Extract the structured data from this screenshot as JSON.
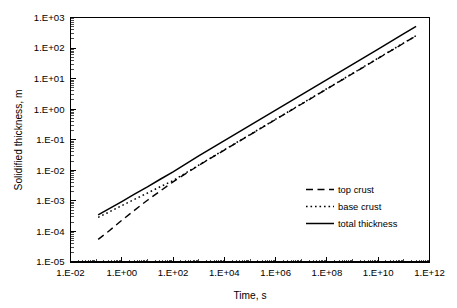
{
  "chart_data": {
    "type": "line",
    "title": "",
    "subtitle": "",
    "xlabel": "Time, s",
    "ylabel": "Solidified thickness, m",
    "xscale": "log",
    "yscale": "log",
    "xlim": [
      0.01,
      1000000000000
    ],
    "ylim": [
      1e-05,
      1000
    ],
    "grid": false,
    "legend_position": "inside-lower-right",
    "x_tick_labels": [
      "1.E-02",
      "1.E+00",
      "1.E+02",
      "1.E+04",
      "1.E+06",
      "1.E+08",
      "1.E+10",
      "1.E+12"
    ],
    "x_tick_values": [
      0.01,
      1,
      100,
      10000,
      1000000,
      100000000,
      10000000000,
      1000000000000
    ],
    "y_tick_labels": [
      "1.E-05",
      "1.E-04",
      "1.E-03",
      "1.E-02",
      "1.E-01",
      "1.E+00",
      "1.E+01",
      "1.E+02",
      "1.E+03"
    ],
    "y_tick_values": [
      1e-05,
      0.0001,
      0.001,
      0.01,
      0.1,
      1,
      10,
      100,
      1000
    ],
    "minor_ticks": true,
    "series": [
      {
        "name": "top crust",
        "style": "dashed",
        "color": "#000000",
        "x": [
          0.12,
          0.3,
          1,
          3,
          10,
          31.6,
          100,
          1000,
          10000,
          100000,
          1000000,
          10000000,
          100000000,
          1000000000,
          10000000000,
          100000000000,
          300000000000
        ],
        "y": [
          5.5e-05,
          0.0001,
          0.00023,
          0.00048,
          0.00105,
          0.0021,
          0.0042,
          0.0145,
          0.046,
          0.145,
          0.46,
          1.45,
          4.6,
          14.5,
          46,
          145,
          250
        ]
      },
      {
        "name": "base crust",
        "style": "dotted",
        "color": "#000000",
        "x": [
          0.12,
          0.3,
          1,
          3,
          10,
          31.6,
          100,
          1000,
          10000,
          100000,
          1000000,
          10000000,
          100000000,
          1000000000,
          10000000000,
          100000000000,
          300000000000
        ],
        "y": [
          0.00029,
          0.00042,
          0.0007,
          0.0011,
          0.0018,
          0.0029,
          0.0046,
          0.0148,
          0.047,
          0.148,
          0.47,
          1.48,
          4.7,
          14.8,
          47,
          148,
          255
        ]
      },
      {
        "name": "total thickness",
        "style": "solid",
        "color": "#000000",
        "x": [
          0.12,
          0.3,
          1,
          3,
          10,
          31.6,
          100,
          1000,
          10000,
          100000,
          1000000,
          10000000,
          100000000,
          1000000000,
          10000000000,
          100000000000,
          300000000000
        ],
        "y": [
          0.00035,
          0.00054,
          0.00095,
          0.00163,
          0.00285,
          0.0051,
          0.0089,
          0.0295,
          0.093,
          0.295,
          0.93,
          2.95,
          9.3,
          29.5,
          93,
          295,
          510
        ]
      }
    ]
  },
  "legend": {
    "entries": [
      {
        "label": "top crust",
        "style": "dashed"
      },
      {
        "label": "base crust",
        "style": "dotted"
      },
      {
        "label": "total thickness",
        "style": "solid"
      }
    ]
  }
}
